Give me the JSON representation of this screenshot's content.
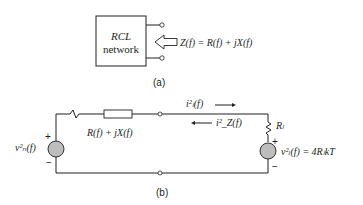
{
  "figure_a": {
    "box_line1": "RCL",
    "box_line2": "network",
    "impedance_label": "Z(f) = R(f) + jX(f)",
    "caption": "(a)"
  },
  "figure_b": {
    "source_label": "v²ₙ(f)",
    "source_plus": "+",
    "source_minus": "−",
    "impedance_label": "R(f) + jX(f)",
    "current_load_label": "i²ₗ(f)",
    "current_z_label": "i²_Z(f)",
    "load_resistor_label": "Rₗ",
    "load_source_label": "v²ₗ(f) = 4RₗkT",
    "load_plus": "+",
    "load_minus": "−",
    "caption": "(b)"
  },
  "colors": {
    "line": "#231f20",
    "source_fill": "#bdbdbd"
  }
}
